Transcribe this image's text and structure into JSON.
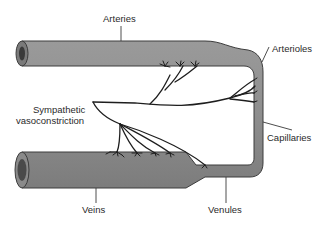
{
  "diagram": {
    "labels": {
      "arteries": "Arteries",
      "arterioles": "Arterioles",
      "sympathetic_line1": "Sympathetic",
      "sympathetic_line2": "vasoconstriction",
      "capillaries": "Capillaries",
      "veins": "Veins",
      "venules": "Venules"
    },
    "components": [
      {
        "id": "arteries",
        "type": "large vessel",
        "position": "top-left"
      },
      {
        "id": "arterioles",
        "type": "small vessel",
        "position": "top-right bend"
      },
      {
        "id": "capillaries",
        "type": "narrow vessel",
        "position": "right vertical"
      },
      {
        "id": "venules",
        "type": "small vessel",
        "position": "bottom-right"
      },
      {
        "id": "veins",
        "type": "large vessel",
        "position": "bottom-left"
      },
      {
        "id": "sympathetic-nerve",
        "type": "nerve",
        "position": "center",
        "innervates": [
          "arteries",
          "arterioles",
          "veins",
          "venules"
        ]
      }
    ],
    "colors": {
      "vessel_fill": "#8c8c8c",
      "vessel_edge": "#3c3c3c",
      "lumen": "#4a4a4a",
      "nerve": "#1e1e1e",
      "text": "#2a2a2a",
      "background": "#ffffff"
    }
  }
}
